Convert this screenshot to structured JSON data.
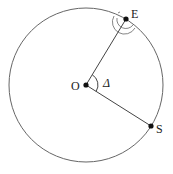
{
  "diagram": {
    "labels": {
      "earth": "E",
      "station": "S",
      "center": "O",
      "angle": "Δ"
    },
    "colors": {
      "stroke": "#555555",
      "point": "#111111"
    }
  }
}
